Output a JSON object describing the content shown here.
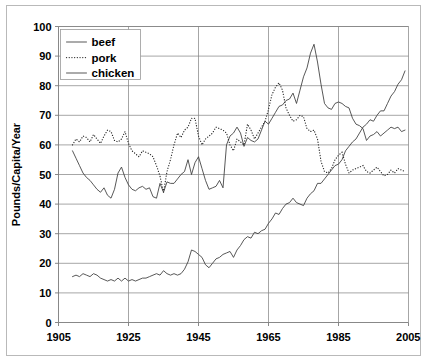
{
  "chart_data": {
    "type": "line",
    "title": "",
    "xlabel": "",
    "ylabel": "Pounds/Capita/Year",
    "xlim": [
      1905,
      2005
    ],
    "ylim": [
      0,
      100
    ],
    "grid": true,
    "legend_position": "top-left",
    "xticks": [
      "1905",
      "1925",
      "1945",
      "1965",
      "1985",
      "2005"
    ],
    "xtick_values": [
      1905,
      1925,
      1945,
      1965,
      1985,
      2005
    ],
    "yticks": [
      "0",
      "10",
      "20",
      "30",
      "40",
      "50",
      "60",
      "70",
      "80",
      "90",
      "100"
    ],
    "ytick_values": [
      0,
      10,
      20,
      30,
      40,
      50,
      60,
      70,
      80,
      90,
      100
    ],
    "series": [
      {
        "name": "beef",
        "style": "solid",
        "color": "#3a3a3a",
        "x": [
          1909,
          1910,
          1911,
          1912,
          1913,
          1914,
          1915,
          1916,
          1917,
          1918,
          1919,
          1920,
          1921,
          1922,
          1923,
          1924,
          1925,
          1926,
          1927,
          1928,
          1929,
          1930,
          1931,
          1932,
          1933,
          1934,
          1935,
          1936,
          1937,
          1938,
          1939,
          1940,
          1941,
          1942,
          1943,
          1944,
          1945,
          1946,
          1947,
          1948,
          1949,
          1950,
          1951,
          1952,
          1953,
          1954,
          1955,
          1956,
          1957,
          1958,
          1959,
          1960,
          1961,
          1962,
          1963,
          1964,
          1965,
          1966,
          1967,
          1968,
          1969,
          1970,
          1971,
          1972,
          1973,
          1974,
          1975,
          1976,
          1977,
          1978,
          1979,
          1980,
          1981,
          1982,
          1983,
          1984,
          1985,
          1986,
          1987,
          1988,
          1989,
          1990,
          1991,
          1992,
          1993,
          1994,
          1995,
          1996,
          1997,
          1998,
          1999,
          2000,
          2001,
          2002,
          2003,
          2004
        ],
        "y": [
          58.0,
          55.5,
          53.0,
          50.5,
          49.0,
          48.0,
          46.5,
          45.0,
          44.0,
          45.5,
          43.0,
          42.0,
          45.0,
          50.5,
          52.5,
          49.0,
          46.5,
          45.0,
          44.5,
          45.5,
          46.0,
          45.0,
          45.5,
          42.5,
          42.0,
          47.0,
          44.0,
          47.5,
          47.0,
          47.0,
          48.5,
          50.0,
          51.0,
          55.0,
          50.0,
          54.0,
          56.0,
          52.0,
          48.0,
          45.0,
          45.5,
          46.0,
          48.0,
          45.5,
          60.0,
          63.0,
          64.0,
          66.0,
          64.0,
          59.5,
          62.5,
          61.5,
          61.0,
          62.0,
          65.0,
          68.0,
          67.0,
          69.0,
          71.0,
          73.0,
          73.5,
          75.0,
          75.5,
          77.5,
          74.0,
          78.5,
          83.0,
          86.0,
          91.0,
          94.0,
          88.0,
          80.5,
          74.0,
          72.5,
          72.0,
          74.0,
          74.5,
          74.0,
          73.0,
          72.5,
          69.0,
          67.0,
          66.5,
          65.5,
          61.5,
          63.0,
          63.5,
          64.5,
          63.0,
          64.0,
          65.0,
          66.0,
          65.5,
          66.0,
          64.5,
          65.0
        ]
      },
      {
        "name": "pork",
        "style": "dotted",
        "color": "#2b2b2b",
        "x": [
          1909,
          1910,
          1911,
          1912,
          1913,
          1914,
          1915,
          1916,
          1917,
          1918,
          1919,
          1920,
          1921,
          1922,
          1923,
          1924,
          1925,
          1926,
          1927,
          1928,
          1929,
          1930,
          1931,
          1932,
          1933,
          1934,
          1935,
          1936,
          1937,
          1938,
          1939,
          1940,
          1941,
          1942,
          1943,
          1944,
          1945,
          1946,
          1947,
          1948,
          1949,
          1950,
          1951,
          1952,
          1953,
          1954,
          1955,
          1956,
          1957,
          1958,
          1959,
          1960,
          1961,
          1962,
          1963,
          1964,
          1965,
          1966,
          1967,
          1968,
          1969,
          1970,
          1971,
          1972,
          1973,
          1974,
          1975,
          1976,
          1977,
          1978,
          1979,
          1980,
          1981,
          1982,
          1983,
          1984,
          1985,
          1986,
          1987,
          1988,
          1989,
          1990,
          1991,
          1992,
          1993,
          1994,
          1995,
          1996,
          1997,
          1998,
          1999,
          2000,
          2001,
          2002,
          2003,
          2004
        ],
        "y": [
          60.0,
          62.0,
          61.0,
          63.0,
          62.5,
          61.0,
          63.5,
          62.0,
          60.5,
          63.0,
          65.0,
          64.5,
          61.5,
          61.0,
          62.0,
          64.5,
          60.5,
          58.0,
          57.0,
          56.0,
          58.0,
          57.5,
          57.0,
          56.0,
          53.0,
          49.5,
          44.0,
          51.0,
          55.0,
          60.0,
          64.0,
          62.5,
          65.0,
          66.0,
          69.0,
          69.0,
          63.0,
          60.0,
          62.0,
          63.0,
          64.0,
          66.0,
          65.5,
          65.0,
          64.0,
          60.0,
          58.0,
          62.0,
          61.0,
          60.0,
          67.0,
          65.0,
          62.0,
          64.0,
          66.0,
          68.0,
          72.0,
          77.0,
          79.5,
          81.0,
          78.5,
          72.5,
          70.0,
          68.0,
          68.5,
          70.0,
          69.5,
          65.5,
          64.5,
          65.0,
          62.0,
          54.5,
          51.0,
          50.5,
          52.0,
          55.0,
          56.5,
          57.5,
          53.5,
          50.5,
          51.5,
          52.0,
          52.5,
          53.0,
          51.0,
          50.5,
          51.5,
          52.5,
          51.0,
          49.5,
          50.0,
          51.5,
          50.5,
          52.0,
          51.5,
          51.0
        ]
      },
      {
        "name": "chicken",
        "style": "solid",
        "color": "#3a3a3a",
        "x": [
          1909,
          1910,
          1911,
          1912,
          1913,
          1914,
          1915,
          1916,
          1917,
          1918,
          1919,
          1920,
          1921,
          1922,
          1923,
          1924,
          1925,
          1926,
          1927,
          1928,
          1929,
          1930,
          1931,
          1932,
          1933,
          1934,
          1935,
          1936,
          1937,
          1938,
          1939,
          1940,
          1941,
          1942,
          1943,
          1944,
          1945,
          1946,
          1947,
          1948,
          1949,
          1950,
          1951,
          1952,
          1953,
          1954,
          1955,
          1956,
          1957,
          1958,
          1959,
          1960,
          1961,
          1962,
          1963,
          1964,
          1965,
          1966,
          1967,
          1968,
          1969,
          1970,
          1971,
          1972,
          1973,
          1974,
          1975,
          1976,
          1977,
          1978,
          1979,
          1980,
          1981,
          1982,
          1983,
          1984,
          1985,
          1986,
          1987,
          1988,
          1989,
          1990,
          1991,
          1992,
          1993,
          1994,
          1995,
          1996,
          1997,
          1998,
          1999,
          2000,
          2001,
          2002,
          2003,
          2004
        ],
        "y": [
          15.5,
          16.0,
          15.5,
          16.5,
          16.0,
          15.5,
          16.5,
          16.0,
          15.0,
          14.5,
          14.0,
          14.5,
          14.0,
          15.0,
          14.0,
          15.0,
          14.0,
          14.5,
          14.0,
          14.5,
          15.0,
          15.0,
          15.5,
          16.0,
          16.5,
          16.0,
          17.5,
          16.5,
          16.0,
          16.5,
          16.0,
          16.5,
          18.0,
          20.5,
          24.5,
          24.0,
          23.0,
          22.0,
          19.5,
          18.5,
          20.0,
          21.5,
          22.0,
          23.0,
          23.5,
          24.0,
          22.0,
          24.5,
          26.0,
          28.0,
          29.0,
          28.5,
          30.5,
          30.0,
          31.0,
          31.5,
          33.5,
          35.0,
          37.0,
          36.5,
          38.5,
          40.0,
          40.5,
          42.0,
          40.5,
          40.0,
          39.5,
          42.0,
          43.5,
          44.5,
          47.0,
          47.0,
          48.5,
          50.0,
          51.5,
          53.0,
          53.5,
          55.0,
          58.0,
          59.5,
          61.0,
          62.0,
          64.0,
          66.0,
          67.0,
          68.5,
          68.0,
          70.0,
          71.5,
          71.5,
          74.0,
          76.5,
          78.0,
          80.5,
          82.0,
          85.0
        ]
      }
    ]
  },
  "legend": {
    "items": [
      {
        "label": "beef",
        "style": "solid"
      },
      {
        "label": "pork",
        "style": "dotted"
      },
      {
        "label": "chicken",
        "style": "solid"
      }
    ]
  }
}
